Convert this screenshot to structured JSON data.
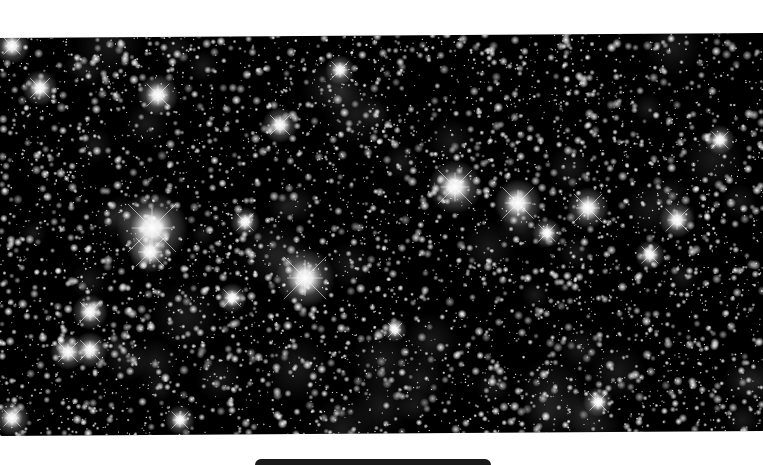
{
  "image": {
    "subject": "Dense star field",
    "width": 763,
    "height": 464,
    "background_color": "#ffffff",
    "sky_color": "#000000",
    "field_polygon": [
      [
        0,
        38
      ],
      [
        763,
        33
      ],
      [
        763,
        431
      ],
      [
        0,
        436
      ]
    ],
    "star_count": 5200,
    "seed": 1337,
    "bright_stars": [
      {
        "x": 152,
        "y": 228,
        "r": 12,
        "spike": 34
      },
      {
        "x": 150,
        "y": 252,
        "r": 7,
        "spike": 20
      },
      {
        "x": 305,
        "y": 278,
        "r": 10,
        "spike": 30
      },
      {
        "x": 455,
        "y": 187,
        "r": 9,
        "spike": 24
      },
      {
        "x": 518,
        "y": 203,
        "r": 8,
        "spike": 22
      },
      {
        "x": 588,
        "y": 208,
        "r": 7,
        "spike": 20
      },
      {
        "x": 677,
        "y": 220,
        "r": 6,
        "spike": 16
      },
      {
        "x": 40,
        "y": 88,
        "r": 6,
        "spike": 14
      },
      {
        "x": 158,
        "y": 95,
        "r": 7,
        "spike": 16
      },
      {
        "x": 90,
        "y": 350,
        "r": 6,
        "spike": 14
      },
      {
        "x": 68,
        "y": 352,
        "r": 6,
        "spike": 14
      },
      {
        "x": 90,
        "y": 312,
        "r": 6,
        "spike": 14
      },
      {
        "x": 280,
        "y": 125,
        "r": 6,
        "spike": 14
      },
      {
        "x": 245,
        "y": 222,
        "r": 5,
        "spike": 12
      },
      {
        "x": 232,
        "y": 298,
        "r": 5,
        "spike": 12
      },
      {
        "x": 547,
        "y": 233,
        "r": 5,
        "spike": 12
      },
      {
        "x": 598,
        "y": 402,
        "r": 5,
        "spike": 12
      },
      {
        "x": 180,
        "y": 420,
        "r": 5,
        "spike": 12
      },
      {
        "x": 12,
        "y": 46,
        "r": 6,
        "spike": 12
      },
      {
        "x": 12,
        "y": 418,
        "r": 6,
        "spike": 12
      },
      {
        "x": 650,
        "y": 255,
        "r": 5,
        "spike": 12
      },
      {
        "x": 720,
        "y": 140,
        "r": 5,
        "spike": 12
      },
      {
        "x": 395,
        "y": 330,
        "r": 4,
        "spike": 10
      },
      {
        "x": 340,
        "y": 70,
        "r": 5,
        "spike": 12
      }
    ]
  },
  "bottom_bar": {
    "color": "#1a1a1a"
  },
  "caption": "Star field image"
}
